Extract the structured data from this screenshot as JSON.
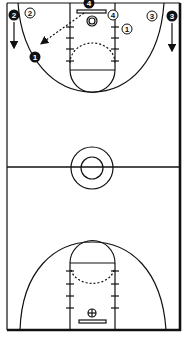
{
  "diagram": {
    "type": "basketball-full-court-play",
    "colors": {
      "line": "#111111",
      "background": "#ffffff",
      "offense_fill": "#111111",
      "offense_text": "#ffffff",
      "defense_fill": "#ffffff",
      "defense_text": "#111111"
    },
    "offense_players": [
      {
        "label": "1",
        "x": 35,
        "y": 57
      },
      {
        "label": "2",
        "x": 13,
        "y": 15
      },
      {
        "label": "3",
        "x": 171,
        "y": 16
      },
      {
        "label": "4",
        "x": 89,
        "y": 3
      }
    ],
    "defense_players": [
      {
        "label": "1",
        "x": 127,
        "y": 29
      },
      {
        "label": "2",
        "x": 30,
        "y": 13
      },
      {
        "label": "3",
        "x": 152,
        "y": 16
      },
      {
        "label": "4",
        "x": 113,
        "y": 15
      }
    ],
    "movements": [
      {
        "type": "pass",
        "style": "dashed",
        "from": "4",
        "to": "1"
      },
      {
        "type": "cut",
        "style": "solid",
        "player": "2",
        "direction": "down"
      },
      {
        "type": "cut",
        "style": "solid",
        "player": "3",
        "direction": "down"
      }
    ]
  }
}
